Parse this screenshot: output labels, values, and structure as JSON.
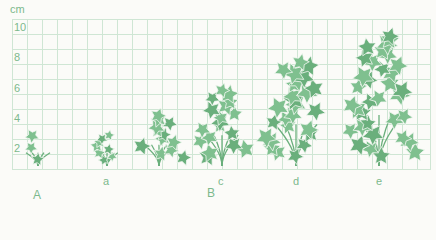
{
  "unit": "cm",
  "y_ticks": [
    {
      "label": "10",
      "y": 21
    },
    {
      "label": "8",
      "y": 51
    },
    {
      "label": "6",
      "y": 82
    },
    {
      "label": "4",
      "y": 112
    },
    {
      "label": "2",
      "y": 142
    }
  ],
  "plants": [
    {
      "id": "A",
      "label": "",
      "cx": 38,
      "height_cm": 2.5,
      "width": 40,
      "stars": 3
    },
    {
      "id": "a",
      "label": "a",
      "cx": 107,
      "height_cm": 2.5,
      "width": 36,
      "stars": 8
    },
    {
      "id": "b",
      "label": "",
      "cx": 159,
      "height_cm": 4,
      "width": 50,
      "stars": 12
    },
    {
      "id": "c",
      "label": "c",
      "cx": 222,
      "height_cm": 5.8,
      "width": 54,
      "stars": 18
    },
    {
      "id": "d",
      "label": "d",
      "cx": 296,
      "height_cm": 7.8,
      "width": 70,
      "stars": 26
    },
    {
      "id": "e",
      "label": "e",
      "cx": 379,
      "height_cm": 9.6,
      "width": 80,
      "stars": 34
    }
  ],
  "plant_labels": [
    {
      "text": "a",
      "x": 103,
      "y": 175
    },
    {
      "text": "c",
      "x": 218,
      "y": 175
    },
    {
      "text": "d",
      "x": 293,
      "y": 175
    },
    {
      "text": "e",
      "x": 376,
      "y": 175
    }
  ],
  "group_labels": [
    {
      "text": "A",
      "x": 33,
      "y": 188
    },
    {
      "text": "B",
      "x": 207,
      "y": 186
    }
  ],
  "colors": {
    "grid": "#cfe6d4",
    "leaf": "#7fc08f",
    "leaf_dark": "#6aaf7c",
    "text": "#7cb98c"
  }
}
